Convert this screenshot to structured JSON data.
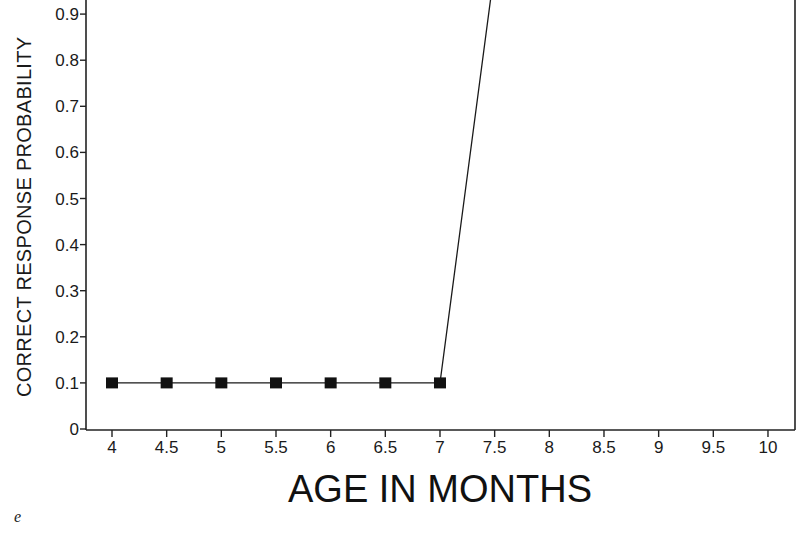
{
  "chart_data": {
    "type": "line",
    "title": "",
    "panel_label": "e",
    "xlabel": "AGE IN MONTHS",
    "ylabel": "CORRECT RESPONSE PROBABILITY",
    "x_ticks": [
      "4",
      "4.5",
      "5",
      "5.5",
      "6",
      "6.5",
      "7",
      "7.5",
      "8",
      "8.5",
      "9",
      "9.5",
      "10"
    ],
    "y_ticks": [
      "0",
      "0.1",
      "0.2",
      "0.3",
      "0.4",
      "0.5",
      "0.6",
      "0.7",
      "0.8",
      "0.9"
    ],
    "xlim": [
      4,
      10
    ],
    "ylim": [
      0,
      0.9
    ],
    "grid": false,
    "legend": null,
    "series": [
      {
        "name": "correct response probability",
        "marker": "square",
        "x": [
          4,
          4.5,
          5,
          5.5,
          6,
          6.5,
          7,
          7.5
        ],
        "values": [
          0.1,
          0.1,
          0.1,
          0.1,
          0.1,
          0.1,
          0.1,
          1.0
        ]
      }
    ],
    "annotations": [
      "value at 7.5 lies above the visible plot area (line exits top edge)"
    ]
  },
  "colors": {
    "line": "#1a1a1a",
    "marker": "#111111",
    "axis": "#222222",
    "background": "#ffffff"
  }
}
